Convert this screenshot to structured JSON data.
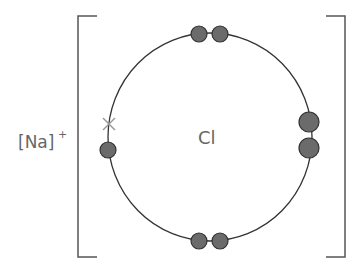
{
  "diagram": {
    "type": "dot-and-cross ionic bonding",
    "cation_label": "[Na]",
    "cation_charge": "+",
    "anion_symbol": "Cl",
    "colors": {
      "bracket": "#555555",
      "shell": "#333333",
      "electron_fill": "#6b6b6b",
      "electron_stroke": "#333333",
      "cross": "#999999",
      "text": "#666666"
    },
    "electron_pairs": [
      "top",
      "right",
      "bottom"
    ],
    "single_electron": "left",
    "transferred_electron_marker": "cross",
    "caption_partial": "..."
  }
}
